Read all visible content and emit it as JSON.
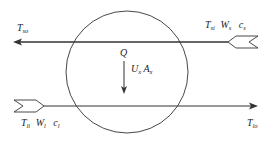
{
  "diagram": {
    "type": "heat-exchanger-control-volume",
    "colors": {
      "line": "#333333",
      "background": "#ffffff"
    },
    "top_stream": {
      "direction": "right-to-left",
      "inlet_labels": {
        "T": "T",
        "T_sub": "si",
        "W": "W",
        "W_sub": "s",
        "c": "c",
        "c_sub": "s"
      },
      "outlet_label": {
        "T": "T",
        "T_sub": "so"
      }
    },
    "bottom_stream": {
      "direction": "left-to-right",
      "inlet_labels": {
        "T": "T",
        "T_sub": "li",
        "W": "W",
        "W_sub": "l",
        "c": "c",
        "c_sub": "l"
      },
      "outlet_label": {
        "T": "T",
        "T_sub": "lo"
      }
    },
    "heat_flow": {
      "Q": "Q",
      "U": "U",
      "U_sub": "x",
      "A": "A",
      "A_sub": "x"
    }
  }
}
